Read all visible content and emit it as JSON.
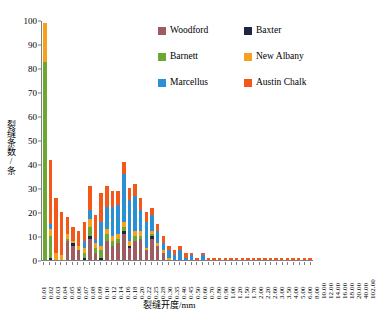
{
  "chart_data": {
    "type": "bar",
    "stacked": true,
    "title": "",
    "xlabel": "裂缝开度/mm",
    "ylabel": "裂缝条数/条",
    "ylim": [
      0,
      100
    ],
    "yticks": [
      0,
      10,
      20,
      30,
      40,
      50,
      60,
      70,
      80,
      90,
      100
    ],
    "grid": false,
    "legend_position": "top-right",
    "categories": [
      "0.01",
      "0.02",
      "0.03",
      "0.04",
      "0.05",
      "0.06",
      "0.07",
      "0.08",
      "0.09",
      "0.10",
      "0.12",
      "0.14",
      "0.16",
      "0.18",
      "0.20",
      "0.22",
      "0.25",
      "0.28",
      "0.30",
      "0.35",
      "0.40",
      "0.45",
      "0.50",
      "0.60",
      "0.70",
      "0.80",
      "0.90",
      "1.00",
      "1.20",
      "1.50",
      "1.70",
      "2.00",
      "2.20",
      "2.60",
      "3.00",
      "3.50",
      "4.00",
      "5.00",
      "6.00",
      "8.00",
      "10.00",
      "12.00",
      "14.00",
      "16.00",
      "18.00",
      "20.00",
      "40.00",
      "102.00"
    ],
    "series": [
      {
        "name": "Woodford",
        "color": "#9e5b60",
        "values": [
          0,
          0,
          0,
          0,
          8,
          6,
          4,
          0,
          9,
          3,
          0,
          8,
          6,
          7,
          11,
          5,
          8,
          9,
          4,
          9,
          6,
          3,
          0,
          0,
          0,
          0,
          0,
          0,
          0,
          0,
          0,
          0,
          0,
          0,
          0,
          0,
          0,
          0,
          0,
          0,
          0,
          0,
          0,
          0,
          0,
          0,
          0,
          0
        ]
      },
      {
        "name": "Baxter",
        "color": "#1f2544",
        "values": [
          0,
          1,
          0,
          0,
          0,
          1,
          0,
          1,
          1,
          0,
          1,
          0,
          0,
          0,
          1,
          1,
          0,
          0,
          0,
          1,
          0,
          0,
          0,
          0,
          0,
          0,
          0,
          0,
          0,
          0,
          0,
          0,
          0,
          0,
          0,
          0,
          0,
          0,
          0,
          0,
          0,
          0,
          0,
          0,
          0,
          0,
          0,
          0
        ]
      },
      {
        "name": "Barnett",
        "color": "#6aa832",
        "values": [
          83,
          9,
          0,
          0,
          1,
          0,
          0,
          2,
          4,
          2,
          3,
          3,
          2,
          2,
          2,
          0,
          2,
          1,
          0,
          1,
          0,
          0,
          0,
          0,
          0,
          0,
          0,
          0,
          0,
          0,
          0,
          0,
          0,
          0,
          0,
          0,
          0,
          0,
          0,
          0,
          0,
          0,
          0,
          0,
          0,
          0,
          0,
          0
        ]
      },
      {
        "name": "New Albany",
        "color": "#f5a11e",
        "values": [
          16,
          3,
          3,
          2,
          2,
          1,
          2,
          2,
          3,
          2,
          2,
          2,
          2,
          2,
          2,
          2,
          2,
          2,
          1,
          1,
          1,
          1,
          1,
          0,
          0,
          0,
          0,
          0,
          0,
          0,
          0,
          0,
          0,
          0,
          0,
          0,
          0,
          0,
          0,
          0,
          0,
          0,
          0,
          0,
          0,
          0,
          0,
          0
        ]
      },
      {
        "name": "Marcellus",
        "color": "#2b8fd6",
        "values": [
          0,
          2,
          0,
          0,
          0,
          0,
          0,
          3,
          4,
          2,
          10,
          9,
          12,
          12,
          20,
          17,
          15,
          9,
          11,
          7,
          5,
          3,
          3,
          2,
          4,
          1,
          2,
          0,
          2,
          0,
          0,
          0,
          0,
          0,
          0,
          0,
          0,
          0,
          0,
          0,
          0,
          0,
          0,
          0,
          0,
          0,
          0,
          0
        ]
      },
      {
        "name": "Austin Chalk",
        "color": "#f4571a",
        "values": [
          0,
          27,
          23,
          18,
          7,
          6,
          6,
          8,
          10,
          10,
          12,
          9,
          7,
          6,
          5,
          5,
          5,
          5,
          4,
          3,
          3,
          3,
          2,
          2,
          2,
          2,
          1,
          1,
          1,
          1,
          1,
          1,
          1,
          1,
          1,
          1,
          1,
          1,
          1,
          1,
          1,
          1,
          1,
          1,
          1,
          1,
          1,
          1
        ]
      }
    ]
  },
  "legend": {
    "items": [
      {
        "label": "Woodford",
        "color": "#9e5b60"
      },
      {
        "label": "Baxter",
        "color": "#1f2544"
      },
      {
        "label": "Barnett",
        "color": "#6aa832"
      },
      {
        "label": "New Albany",
        "color": "#f5a11e"
      },
      {
        "label": "Marcellus",
        "color": "#2b8fd6"
      },
      {
        "label": "Austin Chalk",
        "color": "#f4571a"
      }
    ]
  }
}
